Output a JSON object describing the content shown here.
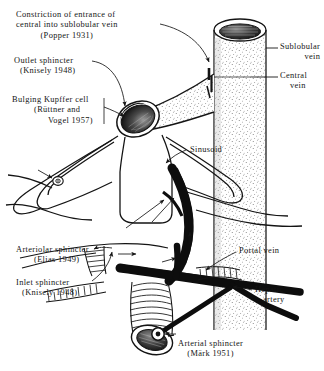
{
  "figure": {
    "style": "black-and-white stippled line drawing",
    "colors": {
      "ink": "#141414",
      "background": "#ffffff",
      "fill_dark": "#111111",
      "stipple": "#4a4a4a"
    }
  },
  "labels": {
    "constriction": {
      "line1": "Constriction of entrance of",
      "line2": "central into sublobular vein",
      "line3": "(Popper 1931)"
    },
    "outlet_sphincter": {
      "line1": "Outlet sphincter",
      "line2": "(Knisely 1948)"
    },
    "kupffer": {
      "line1": "Bulging Kupffer cell",
      "line2": "(Rüttner and",
      "line3": "Vogel 1957)"
    },
    "arteriolar_sphincter": {
      "line1": "Arteriolar sphincter",
      "line2": "(Elias 1949)"
    },
    "inlet_sphincter": {
      "line1": "Inlet sphincter",
      "line2": "(Knisely 1948)"
    },
    "arterial_sphincter": {
      "line1": "Arterial sphincter",
      "line2": "(Märk 1951)"
    },
    "sublobular_vein": {
      "line1": "Sublobular",
      "line2": "vein"
    },
    "central_vein": {
      "line1": "Central",
      "line2": "vein"
    },
    "sinusoid": {
      "line1": "Sinusoid"
    },
    "portal_vein": {
      "line1": "Portal vein"
    },
    "hepatic_artery": {
      "line1": "Hepatic",
      "line2": "artery"
    }
  }
}
